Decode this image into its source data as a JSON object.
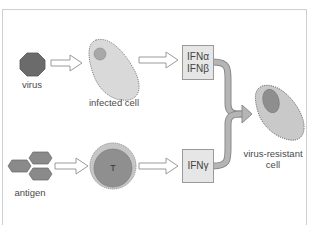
{
  "diagram": {
    "nodes": {
      "virus": {
        "label": "virus",
        "shape": "octagon",
        "color": "#6b6b6b"
      },
      "infected_cell": {
        "label": "infected cell",
        "shape": "cell",
        "color": "#d9d9d9"
      },
      "ifn_alpha_beta": {
        "line1": "IFNα",
        "line2": "IFNβ",
        "shape": "box"
      },
      "antigen": {
        "label": "antigen",
        "shape": "hexagon-cluster",
        "color": "#8a8a8a"
      },
      "t_cell": {
        "label": "T",
        "shape": "circle",
        "color": "#8f8f8f"
      },
      "ifn_gamma": {
        "line1": "IFNγ",
        "shape": "box"
      },
      "resistant_cell": {
        "line1": "virus-resistant",
        "line2": "cell",
        "shape": "cell"
      }
    },
    "edges": [
      {
        "from": "virus",
        "to": "infected_cell",
        "style": "hollow-arrow"
      },
      {
        "from": "infected_cell",
        "to": "ifn_alpha_beta",
        "style": "hollow-arrow"
      },
      {
        "from": "antigen",
        "to": "t_cell",
        "style": "hollow-arrow"
      },
      {
        "from": "t_cell",
        "to": "ifn_gamma",
        "style": "hollow-arrow"
      },
      {
        "from": "ifn_alpha_beta",
        "to": "resistant_cell",
        "style": "gray-curved-arrow"
      },
      {
        "from": "ifn_gamma",
        "to": "resistant_cell",
        "style": "gray-curved-arrow"
      }
    ]
  }
}
